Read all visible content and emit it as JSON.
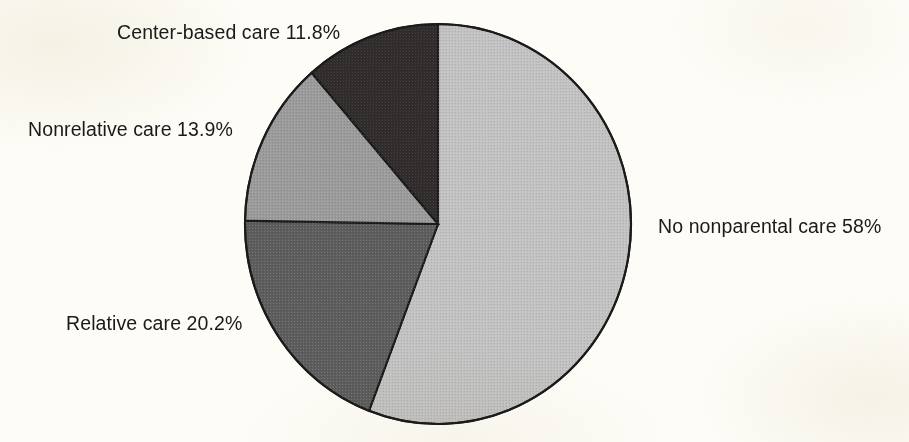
{
  "figure": {
    "background_color": "#fdfcf7",
    "outline_color": "#1b1b1b",
    "label_color": "#1a1a1a"
  },
  "geometry": {
    "center_x": 438,
    "center_y": 224,
    "radius_x": 193,
    "radius_y": 200,
    "start_angle_deg": 0
  },
  "labels": {
    "center_based": "Center-based care 11.8%",
    "nonrelative": "Nonrelative care 13.9%",
    "relative": "Relative care 20.2%",
    "no_nonparental": "No nonparental care 58%"
  },
  "chart_data": {
    "type": "pie",
    "title": "",
    "categories": [
      "No nonparental care",
      "Relative care",
      "Nonrelative care",
      "Center-based care"
    ],
    "values": [
      58,
      20.2,
      13.9,
      11.8
    ],
    "value_unit": "%",
    "labels": [
      "No nonparental care 58%",
      "Relative care 20.2%",
      "Nonrelative care 13.9%",
      "Center-based care 11.8%"
    ],
    "colors": [
      "#c2c2c2",
      "#5d5d5d",
      "#9b9b9b",
      "#2f2b2b"
    ],
    "slice_order": "clockwise from 12 o'clock",
    "legend": "none (direct slice labels)",
    "grid": false
  }
}
